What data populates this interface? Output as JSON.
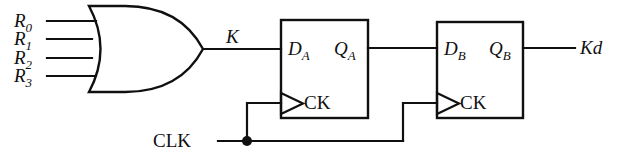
{
  "diagram": {
    "stroke_color": "#101010",
    "background_color": "#ffffff"
  },
  "inputs": [
    {
      "base": "R",
      "sub": "0",
      "name": "input-r0"
    },
    {
      "base": "R",
      "sub": "1",
      "name": "input-r1"
    },
    {
      "base": "R",
      "sub": "2",
      "name": "input-r2"
    },
    {
      "base": "R",
      "sub": "3",
      "name": "input-r3"
    }
  ],
  "gate": {
    "type": "or-gate",
    "input_count": 4,
    "output_label": "K"
  },
  "flipflops": [
    {
      "id": "ff-a",
      "data_base": "D",
      "data_sub": "A",
      "q_base": "Q",
      "q_sub": "A",
      "clock_label": "CK"
    },
    {
      "id": "ff-b",
      "data_base": "D",
      "data_sub": "B",
      "q_base": "Q",
      "q_sub": "B",
      "clock_label": "CK"
    }
  ],
  "clock": {
    "label": "CLK",
    "junction": "clock-junction-dot"
  },
  "output": {
    "label": "Kd"
  }
}
